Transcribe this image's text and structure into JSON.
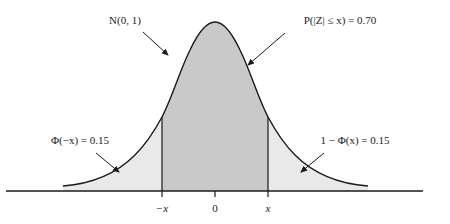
{
  "diagram": {
    "type": "normal-distribution",
    "distribution_label": "N(0, 1)",
    "center_prob_label": "P(|Z| ≤ x) = 0.70",
    "left_tail_label": "Φ(−x) = 0.15",
    "right_tail_label": "1 − Φ(x) = 0.15",
    "axis_ticks": [
      "−x",
      "0",
      "x"
    ],
    "colors": {
      "center_fill": "#c9c9c9",
      "tail_fill": "#e9e9e9",
      "stroke": "#1a1a1a"
    }
  }
}
